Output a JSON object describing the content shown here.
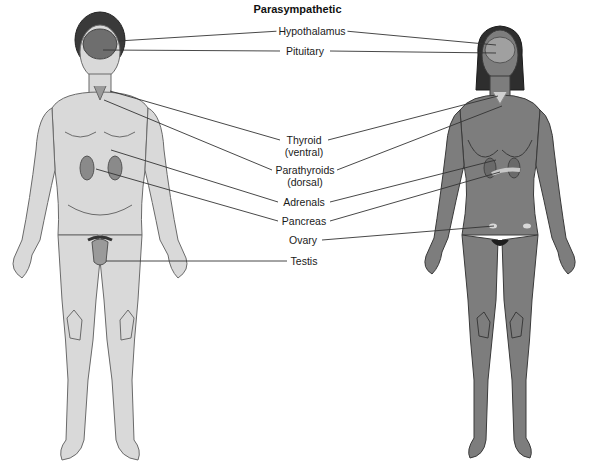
{
  "title": "Parasympathetic",
  "labels": {
    "hypothalamus": "Hypothalamus",
    "pituitary": "Pituitary",
    "thyroid": "Thyroid",
    "thyroid_sub": "(ventral)",
    "parathyroids": "Parathyroids",
    "parathyroids_sub": "(dorsal)",
    "adrenals": "Adrenals",
    "pancreas": "Pancreas",
    "ovary": "Ovary",
    "testis": "Testis"
  },
  "figures": {
    "male": {
      "fill": "#d9d9d9",
      "outline": "#6a6a6a"
    },
    "female": {
      "fill": "#7d7d7d",
      "outline": "#3a3a3a"
    }
  },
  "colors": {
    "leader_line": "#333333",
    "male_brain": "#6e6e6e",
    "female_brain": "#a0a0a0"
  }
}
